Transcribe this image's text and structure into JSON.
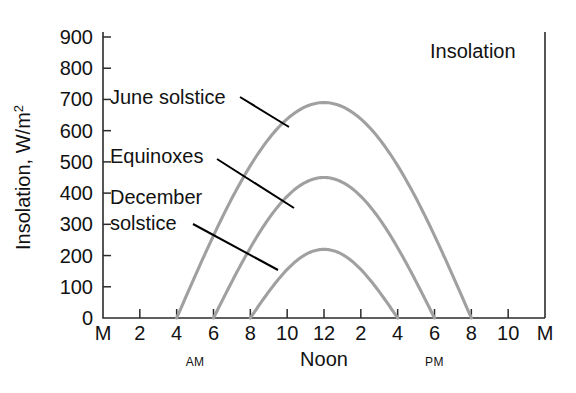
{
  "chart_data": {
    "type": "line",
    "title": "Insolation",
    "xlabel": "",
    "ylabel": "Insolation, W/m²",
    "ylim": [
      0,
      900
    ],
    "ytick_values": [
      0,
      100,
      200,
      300,
      400,
      500,
      600,
      700,
      800,
      900
    ],
    "ytick_labels": [
      "0",
      "100",
      "200",
      "300",
      "400",
      "500",
      "600",
      "700",
      "800",
      "900"
    ],
    "xlim": [
      0,
      24
    ],
    "xtick_hours": [
      0,
      2,
      4,
      6,
      8,
      10,
      12,
      14,
      16,
      18,
      20,
      22,
      24
    ],
    "xtick_labels": [
      "M",
      "2",
      "4",
      "6",
      "8",
      "10",
      "12",
      "2",
      "4",
      "6",
      "8",
      "10",
      "M"
    ],
    "period_labels": [
      {
        "text": "AM",
        "hour": 5
      },
      {
        "text": "Noon",
        "hour": 12
      },
      {
        "text": "PM",
        "hour": 18
      }
    ],
    "grid": false,
    "legend": "inline-annotations",
    "series": [
      {
        "name": "June solstice",
        "sunrise_hour": 4,
        "sunset_hour": 20,
        "peak_hour": 12,
        "peak_value": 690,
        "color": "#a0a0a0"
      },
      {
        "name": "Equinoxes",
        "sunrise_hour": 6,
        "sunset_hour": 18,
        "peak_hour": 12,
        "peak_value": 450,
        "color": "#a0a0a0"
      },
      {
        "name": "December solstice",
        "sunrise_hour": 8,
        "sunset_hour": 16,
        "peak_hour": 12,
        "peak_value": 220,
        "color": "#a0a0a0"
      }
    ],
    "annotations": [
      {
        "text": "June solstice",
        "lines": [
          "June solstice"
        ],
        "label_x": 110,
        "label_y": 104,
        "leader_from": [
          240,
          97
        ],
        "leader_to": [
          289,
          127
        ]
      },
      {
        "text": "Equinoxes",
        "lines": [
          "Equinoxes"
        ],
        "label_x": 110,
        "label_y": 163,
        "leader_from": [
          217,
          159
        ],
        "leader_to": [
          294,
          208
        ]
      },
      {
        "text": "December solstice",
        "lines": [
          "December",
          "solstice"
        ],
        "label_x": 110,
        "label_y": 204,
        "leader_from": [
          193,
          224
        ],
        "leader_to": [
          278,
          270
        ]
      }
    ]
  }
}
